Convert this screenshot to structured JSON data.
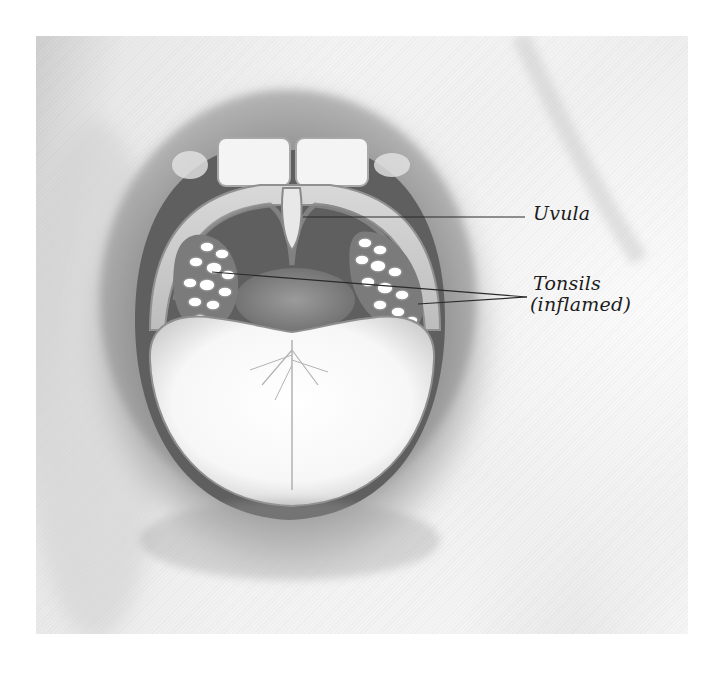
{
  "illustration": {
    "subject": "open mouth showing inflamed tonsils",
    "labels": {
      "uvula": "Uvula",
      "tonsils": "Tonsils",
      "tonsils_note": "(inflamed)"
    },
    "colors": {
      "background": "#ffffff",
      "ink": "#1c1c1c",
      "skin_light": "#f2f2f2",
      "lip_shadow": "#9a9a9a",
      "mouth_dark": "#6e6e6e",
      "tongue": "#fbfbfb"
    }
  }
}
